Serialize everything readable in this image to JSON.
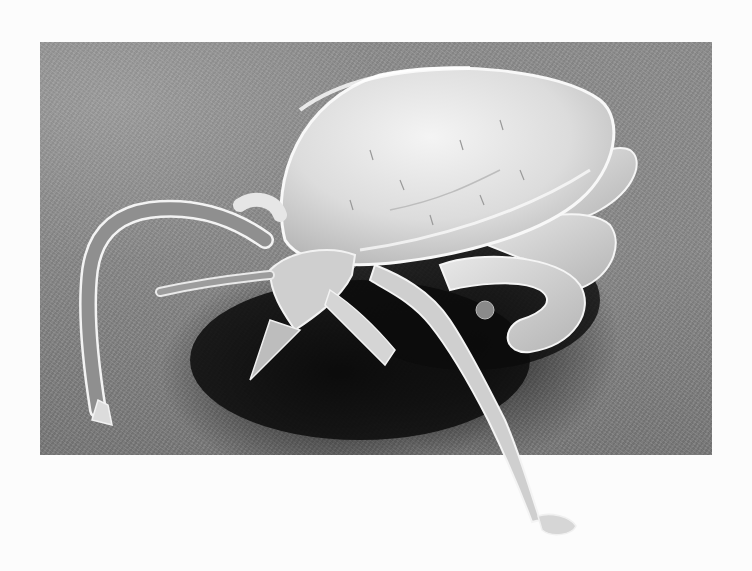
{
  "image": {
    "subject": "tick",
    "type": "scanning-electron-micrograph",
    "palette": {
      "page_background": "#fcfcfc",
      "substrate": "#8a8a8a",
      "shadow": "#0a0a0a",
      "specimen_highlight": "#f2f2f2",
      "specimen_mid": "#c8c8c8"
    }
  }
}
